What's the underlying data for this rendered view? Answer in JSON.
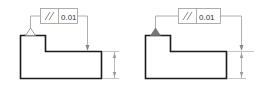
{
  "diagram": {
    "colors": {
      "outline": "#1a1a1a",
      "thin": "#8a8a8a",
      "frame": "#9a9a9a",
      "datum_fill": "#777777"
    },
    "figures": [
      {
        "id": "left",
        "datum_triangle": "open",
        "feature_control_frame": {
          "symbol": "//",
          "symbol_name": "parallelism",
          "tolerance": "0.01"
        }
      },
      {
        "id": "right",
        "datum_triangle": "filled",
        "feature_control_frame": {
          "symbol": "//",
          "symbol_name": "parallelism",
          "tolerance": "0.01"
        }
      }
    ]
  }
}
